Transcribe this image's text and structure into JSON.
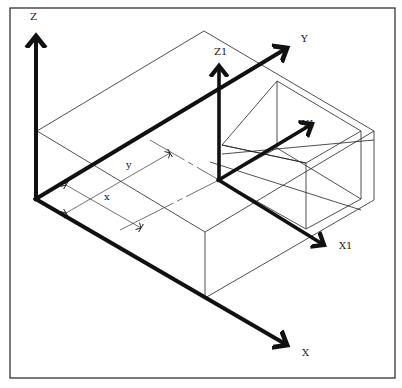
{
  "figure": {
    "colors": {
      "background": "#ffffff",
      "ink": "#111111",
      "thin_line": "#222222"
    },
    "axes": {
      "main": {
        "x_label": "X",
        "y_label": "Y",
        "z_label": "Z"
      },
      "sub": {
        "x_label": "X1",
        "y_label": "Y1",
        "z_label": "Z1"
      }
    },
    "dimensions": {
      "x_label": "x",
      "y_label": "y"
    }
  }
}
